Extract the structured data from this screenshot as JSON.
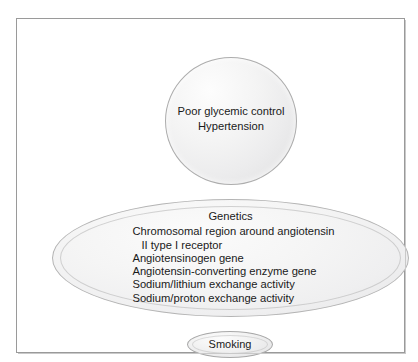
{
  "figure": {
    "background_color": "#ffffff",
    "frame_border_color": "#9a9a9a",
    "shape_fill_color": "#f0f0f0",
    "shape_border_color": "#adadad",
    "text_color": "#1a1a1a"
  },
  "top_circle": {
    "name": "risk-factors-circle",
    "lines": [
      "Poor glycemic control",
      "Hypertension"
    ]
  },
  "genetics_ellipse": {
    "name": "genetics-ellipse",
    "title": "Genetics",
    "items": [
      {
        "text": "Chromosomal region around angiotensin",
        "indented": false
      },
      {
        "text": "II type I receptor",
        "indented": true
      },
      {
        "text": "Angiotensinogen gene",
        "indented": false
      },
      {
        "text": "Angiotensin-converting enzyme gene",
        "indented": false
      },
      {
        "text": "Sodium/lithium exchange activity",
        "indented": false
      },
      {
        "text": "Sodium/proton exchange activity",
        "indented": false
      }
    ]
  },
  "smoking_ellipse": {
    "name": "smoking-ellipse",
    "label": "Smoking"
  }
}
